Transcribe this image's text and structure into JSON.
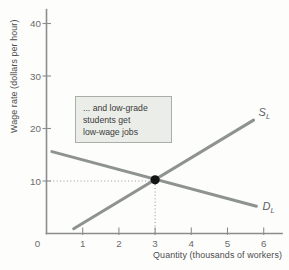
{
  "colors": {
    "curve": "#8e9392",
    "curve_label": "#5a5f5e",
    "axis": "#8d8d8d",
    "tick_label": "#6b6b6b",
    "axis_label": "#4c4c4c",
    "dotted": "#9a9a9a",
    "dot": "#141414",
    "annotation_bg": "#ebede8",
    "annotation_border": "#a9aea6",
    "annotation_text": "#3b3b3b"
  },
  "chart_data": {
    "type": "line",
    "title": "",
    "xlabel": "Quantity (thousands of workers)",
    "ylabel": "Wage rate (dollars per hour)",
    "xlim": [
      0,
      6.53
    ],
    "ylim": [
      0,
      42.8
    ],
    "xticks": [
      0,
      1,
      2,
      3,
      4,
      5,
      6
    ],
    "yticks": [
      10,
      20,
      30,
      40
    ],
    "grid": false,
    "legend": "none",
    "series": [
      {
        "name": "supply",
        "label": "S",
        "subscript": "L",
        "points": [
          [
            0.75,
            0.9
          ],
          [
            5.72,
            21.6
          ]
        ]
      },
      {
        "name": "demand",
        "label": "D",
        "subscript": "L",
        "points": [
          [
            0.15,
            15.6
          ],
          [
            5.8,
            5.2
          ]
        ]
      }
    ],
    "equilibrium": {
      "x": 3,
      "y": 10
    },
    "annotation": {
      "lines": [
        "... and low-grade",
        "students get",
        "low-wage jobs"
      ]
    }
  }
}
